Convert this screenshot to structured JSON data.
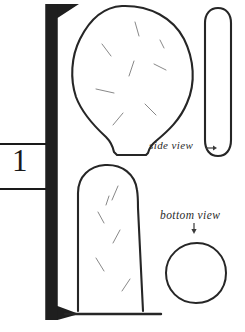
{
  "figure": {
    "kind": "archaeological-artifact-line-drawing",
    "background_color": "#ffffff",
    "ink_color": "#262626",
    "hatch_color": "#6b6b6b",
    "scale_bar": {
      "number_label": "1",
      "orientation": "vertical",
      "bar_color": "#1f1f1f",
      "tick_top_y": 143,
      "tick_bottom_y": 190
    },
    "labels": {
      "side_view": "side view",
      "side_view_arrow": "→",
      "bottom_view": "bottom view",
      "bottom_view_arrow": "↓"
    },
    "views": [
      {
        "name": "front-view-upper",
        "description": "ovoid blade with narrow tang at base",
        "hatch_marks": 8
      },
      {
        "name": "front-view-lower",
        "description": "dome-topped shaft resting on ground line",
        "hatch_marks": 6
      },
      {
        "name": "side-view",
        "description": "narrow elongated capsule profile"
      },
      {
        "name": "bottom-view",
        "description": "circular cross-section"
      }
    ]
  }
}
